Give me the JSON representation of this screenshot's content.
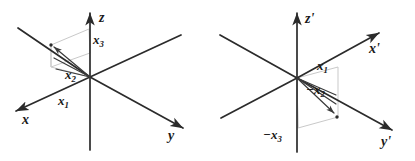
{
  "figure": {
    "title": "",
    "background_color": "#ffffff",
    "axis_color": "#2b2b2b",
    "vector_color": "#3a3a3a",
    "projection_color": "#c9c9c9",
    "label_color": "#1a1a1a",
    "panels": [
      {
        "id": "left",
        "name": "right-handed-coordinate-frame",
        "origin": [
          90,
          77
        ],
        "axes": [
          {
            "name": "x-axis",
            "label": "x",
            "label_pos": [
              22,
              122
            ],
            "line": [
              [
                90,
                77
              ],
              [
                14,
                112
              ]
            ],
            "arrow": true
          },
          {
            "name": "y-axis",
            "label": "y",
            "label_pos": [
              171,
              137
            ],
            "line": [
              [
                90,
                77
              ],
              [
                185,
                129
              ]
            ],
            "arrow": true
          },
          {
            "name": "z-axis",
            "label": "z",
            "label_pos": [
              99,
              18
            ],
            "line": [
              [
                90,
                148
              ],
              [
                90,
                10
              ]
            ],
            "arrow": true
          }
        ],
        "axis_back_segments": [
          {
            "name": "x-axis-back",
            "line": [
              [
                90,
                77
              ],
              [
                180,
                36
              ]
            ]
          },
          {
            "name": "y-axis-back",
            "line": [
              [
                90,
                77
              ],
              [
                18,
                28
              ]
            ]
          }
        ],
        "vectors": [
          {
            "name": "vector-x3-component",
            "label": "x₃",
            "label_text": "x",
            "label_sub": "3",
            "label_pos": [
              96,
              40
            ]
          },
          {
            "name": "vector-x2-component",
            "label": "x₂",
            "label_text": "x",
            "label_sub": "2",
            "label_pos": [
              68,
              75
            ]
          },
          {
            "name": "vector-x1-component",
            "label": "x₁",
            "label_text": "x",
            "label_sub": "1",
            "label_pos": [
              61,
              101
            ]
          }
        ],
        "point": [
          51,
          45
        ],
        "point_foot": [
          51,
          67
        ],
        "box_corners": [
          [
            51,
            45
          ],
          [
            89,
            29
          ],
          [
            89,
            52
          ],
          [
            51,
            67
          ]
        ]
      },
      {
        "id": "right",
        "name": "left-handed-coordinate-frame",
        "origin": [
          297,
          78
        ],
        "axes": [
          {
            "name": "x-prime-axis",
            "label": "x'",
            "label_pos": [
              372,
              48
            ],
            "line": [
              [
                297,
                78
              ],
              [
                382,
                31
              ]
            ],
            "arrow": true
          },
          {
            "name": "y-prime-axis",
            "label": "y'",
            "label_pos": [
              384,
              142
            ],
            "line": [
              [
                297,
                78
              ],
              [
                395,
                132
              ]
            ],
            "arrow": true
          },
          {
            "name": "z-prime-axis",
            "label": "z'",
            "label_pos": [
              305,
              19
            ],
            "line": [
              [
                297,
                150
              ],
              [
                297,
                11
              ]
            ],
            "arrow": true
          }
        ],
        "axis_back_segments": [
          {
            "name": "x-prime-axis-back",
            "line": [
              [
                297,
                78
              ],
              [
                222,
                117
              ]
            ]
          },
          {
            "name": "y-prime-axis-back",
            "line": [
              [
                297,
                78
              ],
              [
                220,
                35
              ]
            ]
          }
        ],
        "vectors": [
          {
            "name": "vector-x1-component",
            "label": "x₁",
            "label_text": "x",
            "label_sub": "1",
            "label_pos": [
              320,
              66
            ]
          },
          {
            "name": "vector-negative-x2-component",
            "label": "−x₂",
            "label_text": "−x",
            "label_sub": "2",
            "label_pos": [
              310,
              90
            ]
          },
          {
            "name": "vector-negative-x3-component",
            "label": "−x₃",
            "label_text": "−x",
            "label_sub": "3",
            "label_pos": [
              270,
              135
            ]
          }
        ],
        "point": [
          337,
          117
        ],
        "point_top": [
          337,
          75
        ],
        "box_corners": [
          [
            297,
            78
          ],
          [
            337,
            68
          ],
          [
            337,
            117
          ],
          [
            297,
            128
          ]
        ]
      }
    ]
  }
}
